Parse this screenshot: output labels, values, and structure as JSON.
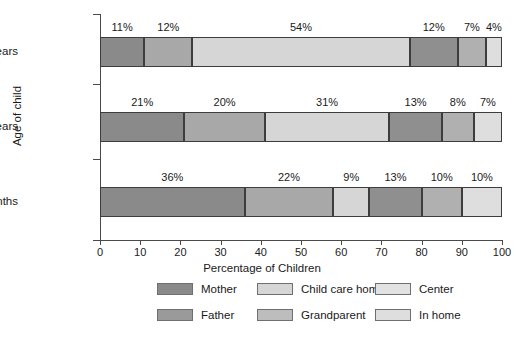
{
  "chart_data": {
    "type": "bar",
    "orientation": "horizontal",
    "stacked": true,
    "title": "",
    "xlabel": "Percentage of Children",
    "ylabel": "Age of child",
    "xlim": [
      0,
      100
    ],
    "xticks": [
      0,
      10,
      20,
      30,
      40,
      50,
      60,
      70,
      80,
      90,
      100
    ],
    "grid": false,
    "legend_position": "bottom",
    "categories": [
      "4½ Years",
      "3 Years",
      "6 Months"
    ],
    "series": [
      {
        "name": "Mother",
        "color": "#8a8a8a",
        "values": [
          11,
          21,
          36
        ]
      },
      {
        "name": "Father",
        "color": "#a8a8a8",
        "values": [
          12,
          20,
          22
        ]
      },
      {
        "name": "Child care home",
        "color": "#d6d6d6",
        "values": [
          54,
          31,
          9
        ]
      },
      {
        "name": "Grandparent",
        "color": "#8f8f8f",
        "values": [
          12,
          13,
          13
        ]
      },
      {
        "name": "Center",
        "color": "#b0b0b0",
        "values": [
          7,
          8,
          10
        ]
      },
      {
        "name": "In home",
        "color": "#dedede",
        "values": [
          4,
          7,
          10
        ]
      }
    ],
    "bars": [
      {
        "category": "4½ Years",
        "segments": [
          {
            "label": "11%",
            "value": 11,
            "series": "Mother",
            "color": "#8a8a8a"
          },
          {
            "label": "12%",
            "value": 12,
            "series": "Father",
            "color": "#a8a8a8"
          },
          {
            "label": "54%",
            "value": 54,
            "series": "Child care home",
            "color": "#d6d6d6"
          },
          {
            "label": "12%",
            "value": 12,
            "series": "Grandparent",
            "color": "#8f8f8f"
          },
          {
            "label": "7%",
            "value": 7,
            "series": "Center",
            "color": "#b0b0b0"
          },
          {
            "label": "4%",
            "value": 4,
            "series": "In home",
            "color": "#dedede"
          }
        ]
      },
      {
        "category": "3 Years",
        "segments": [
          {
            "label": "21%",
            "value": 21,
            "series": "Mother",
            "color": "#8a8a8a"
          },
          {
            "label": "20%",
            "value": 20,
            "series": "Father",
            "color": "#a8a8a8"
          },
          {
            "label": "31%",
            "value": 31,
            "series": "Child care home",
            "color": "#d6d6d6"
          },
          {
            "label": "13%",
            "value": 13,
            "series": "Grandparent",
            "color": "#8f8f8f"
          },
          {
            "label": "8%",
            "value": 8,
            "series": "Center",
            "color": "#b0b0b0"
          },
          {
            "label": "7%",
            "value": 7,
            "series": "In home",
            "color": "#dedede"
          }
        ]
      },
      {
        "category": "6 Months",
        "segments": [
          {
            "label": "36%",
            "value": 36,
            "series": "Mother",
            "color": "#8a8a8a"
          },
          {
            "label": "22%",
            "value": 22,
            "series": "Father",
            "color": "#a8a8a8"
          },
          {
            "label": "9%",
            "value": 9,
            "series": "Child care home",
            "color": "#d6d6d6"
          },
          {
            "label": "13%",
            "value": 13,
            "series": "Grandparent",
            "color": "#8f8f8f"
          },
          {
            "label": "10%",
            "value": 10,
            "series": "Center",
            "color": "#b0b0b0"
          },
          {
            "label": "10%",
            "value": 10,
            "series": "In home",
            "color": "#dedede"
          }
        ]
      }
    ],
    "legend": [
      {
        "label": "Mother",
        "color": "#8a8a8a"
      },
      {
        "label": "Child care home",
        "color": "#d6d6d6"
      },
      {
        "label": "Center",
        "color": "#e2e2e2"
      },
      {
        "label": "Father",
        "color": "#9a9a9a"
      },
      {
        "label": "Grandparent",
        "color": "#bdbdbd"
      },
      {
        "label": "In home",
        "color": "#dedede"
      }
    ]
  }
}
